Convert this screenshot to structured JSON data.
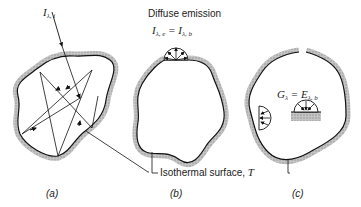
{
  "panels": [
    {
      "id": "a",
      "caption": "(a)",
      "incident_label": "I",
      "incident_sub": "λ, i"
    },
    {
      "id": "b",
      "caption": "(b)",
      "title": "Diffuse emission",
      "equation_lhs": "I",
      "equation_lhs_sub": "λ, e",
      "equation_rhs": "I",
      "equation_rhs_sub": "λ, b"
    },
    {
      "id": "c",
      "caption": "(c)",
      "equation_lhs": "G",
      "equation_lhs_sub": "λ",
      "equation_rhs": "E",
      "equation_rhs_sub": "λ, b"
    }
  ],
  "shared_label": {
    "text": "Isothermal surface, ",
    "symbol": "T"
  },
  "colors": {
    "wall": "#b8b8b8",
    "line": "#1a1a1a"
  }
}
